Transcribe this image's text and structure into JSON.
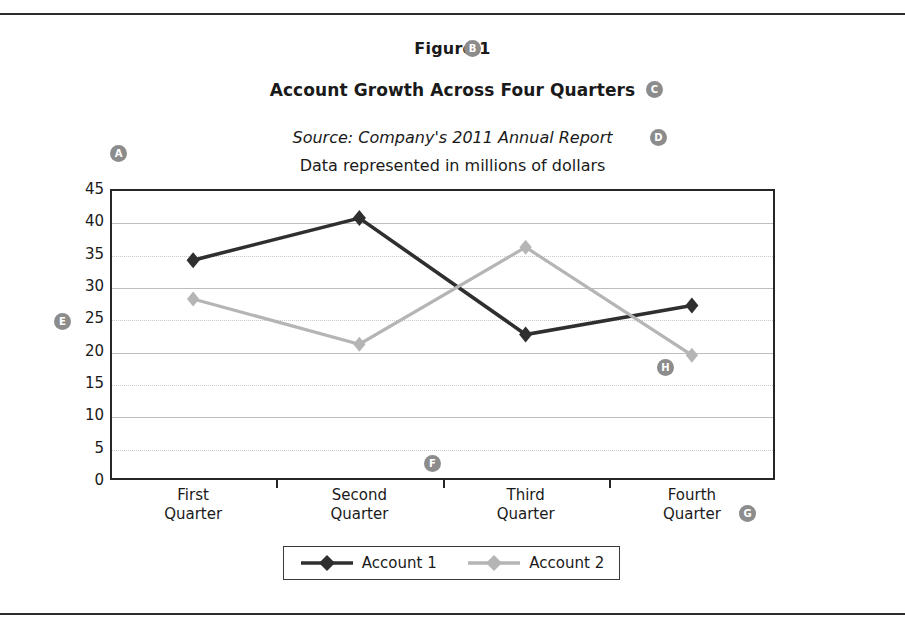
{
  "figure": {
    "label": "Figure 1",
    "title": "Account Growth Across Four Quarters",
    "source": "Source: Company's 2011 Annual Report",
    "subnote": "Data represented in millions of dollars"
  },
  "callouts": [
    {
      "id": "A",
      "letter": "A",
      "name": "callout-a-plot-area",
      "x": 110,
      "y": 145
    },
    {
      "id": "B",
      "letter": "B",
      "name": "callout-b-figure-label",
      "x": 464,
      "y": 40
    },
    {
      "id": "C",
      "letter": "C",
      "name": "callout-c-chart-title",
      "x": 646,
      "y": 81
    },
    {
      "id": "D",
      "letter": "D",
      "name": "callout-d-source-line",
      "x": 650,
      "y": 129
    },
    {
      "id": "E",
      "letter": "E",
      "name": "callout-e-y-axis",
      "x": 54,
      "y": 313
    },
    {
      "id": "F",
      "letter": "F",
      "name": "callout-f-x-axis",
      "x": 424,
      "y": 455
    },
    {
      "id": "G",
      "letter": "G",
      "name": "callout-g-category-label",
      "x": 739,
      "y": 505
    },
    {
      "id": "H",
      "letter": "H",
      "name": "callout-h-data-point",
      "x": 657,
      "y": 359
    }
  ],
  "legend": {
    "items": [
      {
        "label": "Account 1",
        "color": "#2f2f2f"
      },
      {
        "label": "Account 2",
        "color": "#b5b5b5"
      }
    ]
  },
  "colors": {
    "series1": "#2f2f2f",
    "series2": "#b5b5b5",
    "axis": "#262626",
    "grid_solid": "#bdbdbd",
    "grid_dotted": "#c9c9c9",
    "badge": "#8c8c8c"
  },
  "chart_data": {
    "type": "line",
    "title": "Account Growth Across Four Quarters",
    "subtitle": "Data represented in millions of dollars",
    "source": "Source: Company's 2011 Annual Report",
    "xlabel": "",
    "ylabel": "",
    "categories": [
      "First Quarter",
      "Second Quarter",
      "Third Quarter",
      "Fourth Quarter"
    ],
    "category_lines": [
      [
        "First",
        "Quarter"
      ],
      [
        "Second",
        "Quarter"
      ],
      [
        "Third",
        "Quarter"
      ],
      [
        "Fourth",
        "Quarter"
      ]
    ],
    "ylim": [
      0,
      45
    ],
    "yticks": [
      0,
      5,
      10,
      15,
      20,
      25,
      30,
      35,
      40,
      45
    ],
    "grid": true,
    "legend_position": "bottom",
    "marker": "diamond",
    "units": "millions of dollars",
    "series": [
      {
        "name": "Account 1",
        "color": "#2f2f2f",
        "values": [
          34,
          40.5,
          22.5,
          27
        ]
      },
      {
        "name": "Account 2",
        "color": "#b5b5b5",
        "values": [
          28,
          21,
          36,
          19.3
        ]
      }
    ]
  }
}
